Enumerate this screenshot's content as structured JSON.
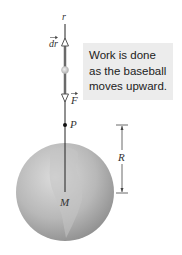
{
  "figure": {
    "caption_lines": [
      "Work is done",
      "as the baseball",
      "moves upward."
    ],
    "labels": {
      "axis": "r",
      "displacement": "dr",
      "force": "F",
      "point": "P",
      "mass": "M",
      "radius": "R"
    },
    "colors": {
      "caption_bg": "#ececec",
      "sphere_light": "#d6d6d6",
      "sphere_dark": "#8e8e8e",
      "line": "#222222",
      "ball": "#c9c9c9"
    }
  }
}
